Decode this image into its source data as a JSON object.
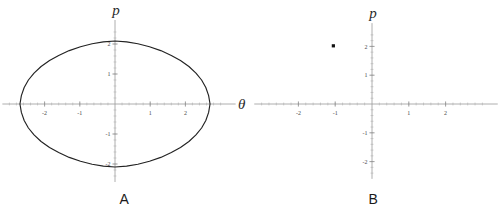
{
  "figure": {
    "background_color": "#ffffff",
    "curve_color": "#222222",
    "axis_color": "#9a9a9a",
    "point_color": "#111111"
  },
  "panels": [
    {
      "caption": "A",
      "axis_x_label": "θ",
      "axis_y_label": "p",
      "x_ticks": [
        "-2",
        "-1",
        "1",
        "2"
      ],
      "y_ticks": [
        "2",
        "1",
        "-1",
        "-2"
      ]
    },
    {
      "caption": "B",
      "axis_x_label": "θ",
      "axis_y_label": "p",
      "x_ticks": [
        "-2",
        "-1",
        "1",
        "2"
      ],
      "y_ticks": [
        "2",
        "1",
        "-1",
        "-2"
      ]
    }
  ],
  "chart_data": [
    {
      "type": "line",
      "title": "A",
      "xlabel": "θ",
      "ylabel": "p",
      "xlim": [
        -3.2,
        3.2
      ],
      "ylim": [
        -2.6,
        2.6
      ],
      "xticks": [
        -2,
        -1,
        1,
        2
      ],
      "yticks": [
        2,
        1,
        -1,
        -2
      ],
      "grid": false,
      "legend": "none",
      "description": "Closed pendulum phase-space orbit (separatrix-like lens) with cusps on the theta axis",
      "series": [
        {
          "name": "orbit",
          "closed": true,
          "theta_max": 2.7,
          "p_max": 2.1,
          "points": [
            [
              2.7,
              0.0
            ],
            [
              2.66,
              0.28
            ],
            [
              2.58,
              0.55
            ],
            [
              2.46,
              0.8
            ],
            [
              2.3,
              1.03
            ],
            [
              2.1,
              1.25
            ],
            [
              1.86,
              1.45
            ],
            [
              1.6,
              1.62
            ],
            [
              1.3,
              1.78
            ],
            [
              0.98,
              1.91
            ],
            [
              0.65,
              2.01
            ],
            [
              0.33,
              2.07
            ],
            [
              0.0,
              2.1
            ],
            [
              -0.33,
              2.07
            ],
            [
              -0.65,
              2.01
            ],
            [
              -0.98,
              1.91
            ],
            [
              -1.3,
              1.78
            ],
            [
              -1.6,
              1.62
            ],
            [
              -1.86,
              1.45
            ],
            [
              -2.1,
              1.25
            ],
            [
              -2.3,
              1.03
            ],
            [
              -2.46,
              0.8
            ],
            [
              -2.58,
              0.55
            ],
            [
              -2.66,
              0.28
            ],
            [
              -2.7,
              0.0
            ],
            [
              -2.66,
              -0.28
            ],
            [
              -2.58,
              -0.55
            ],
            [
              -2.46,
              -0.8
            ],
            [
              -2.3,
              -1.03
            ],
            [
              -2.1,
              -1.25
            ],
            [
              -1.86,
              -1.45
            ],
            [
              -1.6,
              -1.62
            ],
            [
              -1.3,
              -1.78
            ],
            [
              -0.98,
              -1.91
            ],
            [
              -0.65,
              -2.01
            ],
            [
              -0.33,
              -2.07
            ],
            [
              0.0,
              -2.1
            ],
            [
              0.33,
              -2.07
            ],
            [
              0.65,
              -2.01
            ],
            [
              0.98,
              -1.91
            ],
            [
              1.3,
              -1.78
            ],
            [
              1.6,
              -1.62
            ],
            [
              1.86,
              -1.45
            ],
            [
              2.1,
              -1.25
            ],
            [
              2.3,
              -1.03
            ],
            [
              2.46,
              -0.8
            ],
            [
              2.58,
              -0.55
            ],
            [
              2.66,
              -0.28
            ],
            [
              2.7,
              0.0
            ]
          ]
        }
      ]
    },
    {
      "type": "scatter",
      "title": "B",
      "xlabel": "θ",
      "ylabel": "p",
      "xlim": [
        -3.2,
        3.2
      ],
      "ylim": [
        -2.6,
        2.6
      ],
      "xticks": [
        -2,
        -1,
        1,
        2
      ],
      "yticks": [
        2,
        1,
        -1,
        -2
      ],
      "grid": false,
      "legend": "none",
      "description": "Single phase-space point in the second quadrant",
      "series": [
        {
          "name": "state",
          "points": [
            [
              -1.05,
              2.02
            ]
          ]
        }
      ]
    }
  ]
}
